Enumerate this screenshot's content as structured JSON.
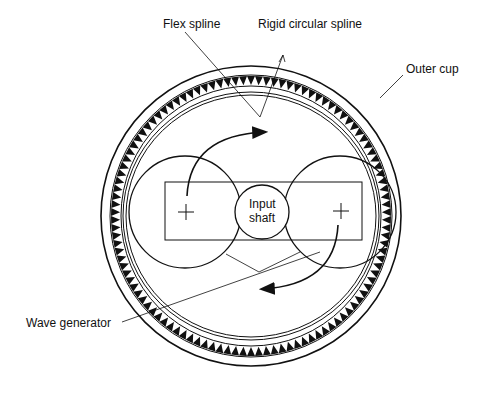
{
  "diagram": {
    "labels": {
      "flex_spline": "Flex spline",
      "rigid_spline": "Rigid circular spline",
      "outer_cup": "Outer cup",
      "input_shaft_line1": "Input",
      "input_shaft_line2": "shaft",
      "wave_generator": "Wave generator"
    },
    "colors": {
      "stroke": "#111111",
      "background": "#ffffff"
    }
  }
}
